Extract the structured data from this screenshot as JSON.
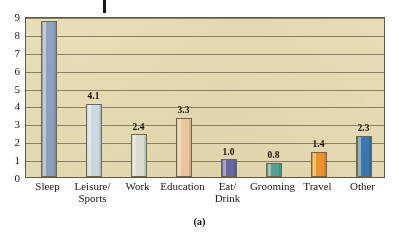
{
  "figure": {
    "caption": "(a)",
    "top_mark": "page-tick-mark",
    "plot_background_color": "#e9e0bb",
    "gridline_color": "#8c8468",
    "frame_color": "#5d5a49"
  },
  "chart_data": {
    "type": "bar",
    "title": "",
    "subtitle": "",
    "xlabel": "",
    "ylabel": "",
    "ylim": [
      0,
      9
    ],
    "ytick_step": 1,
    "yticks": [
      "0",
      "1",
      "2",
      "3",
      "4",
      "5",
      "6",
      "7",
      "8",
      "9"
    ],
    "grid": true,
    "legend": "none",
    "categories": [
      "Sleep",
      "Leisure/ Sports",
      "Work",
      "Education",
      "Eat/ Drink",
      "Grooming",
      "Travel",
      "Other"
    ],
    "category_lines": [
      [
        "Sleep",
        ""
      ],
      [
        "Leisure/",
        "Sports"
      ],
      [
        "Work",
        ""
      ],
      [
        "Education",
        ""
      ],
      [
        "Eat/",
        "Drink"
      ],
      [
        "Grooming",
        ""
      ],
      [
        "Travel",
        ""
      ],
      [
        "Other",
        ""
      ]
    ],
    "values": [
      8.7,
      4.1,
      2.4,
      3.3,
      1.0,
      0.8,
      1.4,
      2.3
    ],
    "value_labels": [
      "8.7",
      "4.1",
      "2.4",
      "3.3",
      "1.0",
      "0.8",
      "1.4",
      "2.3"
    ],
    "bar_colors": [
      "#8ea4c8",
      "#cfe0ee",
      "#e3e4e1",
      "#f3ceaa",
      "#6a6bad",
      "#52a8a2",
      "#ef9b2b",
      "#3a7cba"
    ]
  }
}
